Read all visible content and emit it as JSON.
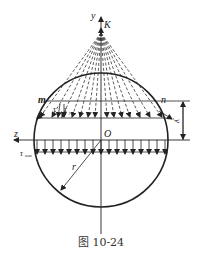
{
  "figure": {
    "caption": "图 10-24",
    "labels": {
      "y_axis": "y",
      "z_axis": "z",
      "point_k": "K",
      "origin": "O",
      "point_m": "m",
      "point_n": "n",
      "tau": "τ",
      "tau_y": "τ",
      "tau_y_sub": "y",
      "tau_max": "τ",
      "tau_max_sub": "max",
      "radius": "r",
      "dim_y": "y"
    },
    "colors": {
      "stroke": "#222222",
      "background": "#ffffff"
    }
  }
}
